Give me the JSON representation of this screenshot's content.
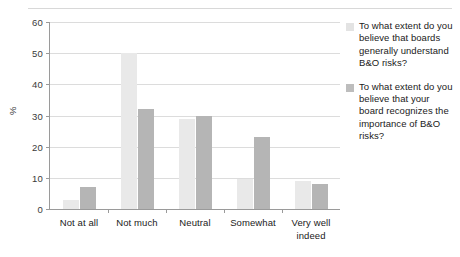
{
  "chart_data": {
    "type": "bar",
    "title": "",
    "subtitle": "",
    "xlabel": "",
    "ylabel": "%",
    "ylim": [
      0,
      60
    ],
    "yticks": [
      0,
      10,
      20,
      30,
      40,
      50,
      60
    ],
    "ytick_labels": [
      "0",
      "10",
      "20",
      "30",
      "40",
      "50",
      "60"
    ],
    "grid": true,
    "grid_axis": "y",
    "legend_position": "right",
    "orientation": "vertical",
    "grouping": "grouped",
    "categories": [
      "Not at all",
      "Not much",
      "Neutral",
      "Somewhat",
      "Very well indeed"
    ],
    "series": [
      {
        "name": "To what extent do you believe that boards generally understand B&O risks?",
        "color": "#e9e9e9",
        "values": [
          3,
          50,
          29,
          9.5,
          9
        ]
      },
      {
        "name": "To what extent do you believe that your board recognizes the importance of B&O risks?",
        "color": "#b5b5b5",
        "values": [
          7,
          32,
          30,
          23,
          8
        ]
      }
    ]
  },
  "axis": {
    "y_title": "%"
  },
  "legend": {
    "entries": [
      {
        "label": "To what extent do you believe that boards generally understand B&O risks?"
      },
      {
        "label": "To what extent do you believe that your board recognizes the importance of B&O risks?"
      }
    ]
  },
  "colors": {
    "series_light": "#e9e9e9",
    "series_dark": "#b5b5b5",
    "gridline": "#dcdcdc",
    "axis": "#9a9a9a",
    "text": "#1a1a1a",
    "rule": "#d8d8d8"
  }
}
